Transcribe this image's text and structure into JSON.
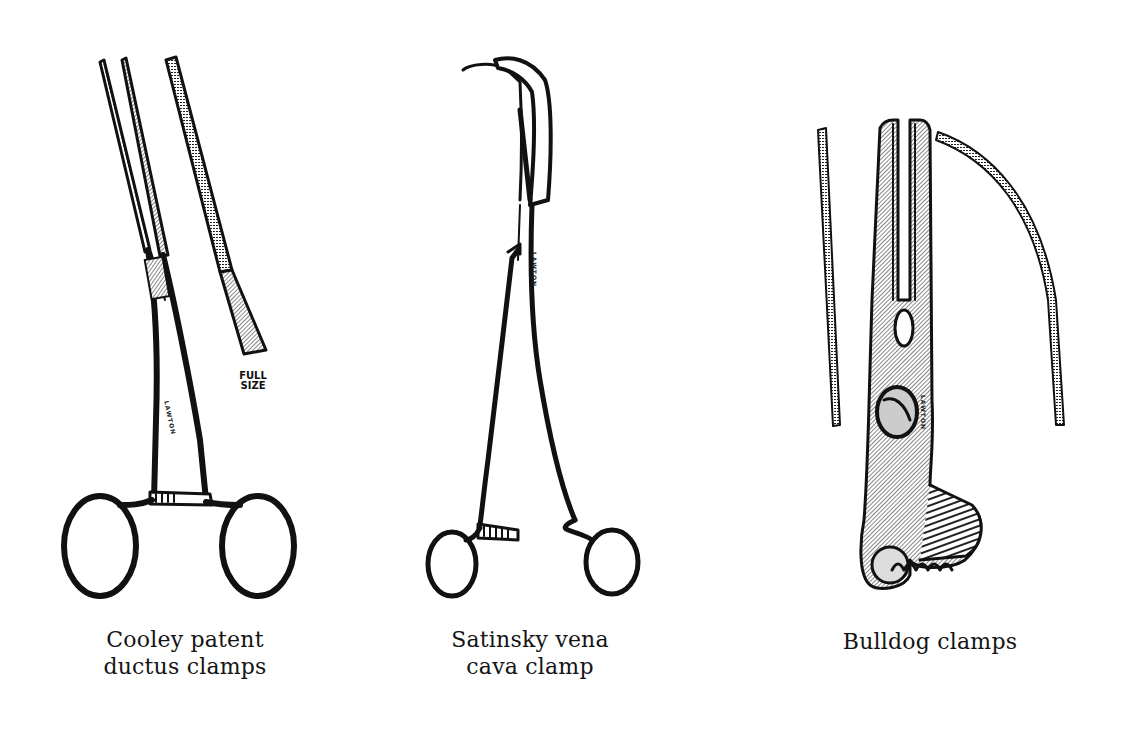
{
  "figure": {
    "instruments": [
      {
        "id": "cooley",
        "caption_line1": "Cooley patent",
        "caption_line2": "ductus clamps",
        "annotation_line1": "FULL",
        "annotation_line2": "SIZE",
        "engraving": "LAWTON"
      },
      {
        "id": "satinsky",
        "caption_line1": "Satinsky vena",
        "caption_line2": "cava clamp",
        "engraving": "LAWTON"
      },
      {
        "id": "bulldog",
        "caption_line1": "Bulldog clamps",
        "engraving": "LAWTON"
      }
    ]
  }
}
